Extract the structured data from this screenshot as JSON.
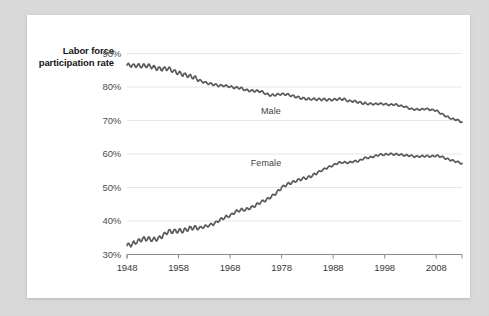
{
  "figure": {
    "background_color": "#dcdcdc",
    "card_color": "#ffffff",
    "line_color": "#5a5a5a",
    "grid_color": "#e6e6e6",
    "axis_color": "#8c8c8c"
  },
  "axis_title": "Labor force participation rate",
  "chart_data": {
    "type": "line",
    "title": "",
    "subtitle": "",
    "xlabel": "",
    "ylabel": "Labor force participation rate",
    "xlim": [
      1948,
      2013
    ],
    "ylim": [
      30,
      90
    ],
    "grid": true,
    "grid_axis": "y",
    "legend": "inline-annotations",
    "ytick_labels": [
      "90%",
      "80%",
      "70%",
      "60%",
      "50%",
      "40%",
      "30%"
    ],
    "ytick_values": [
      90,
      80,
      70,
      60,
      50,
      40,
      30
    ],
    "xtick_labels": [
      "1948",
      "1958",
      "1968",
      "1978",
      "1988",
      "1998",
      "2008"
    ],
    "xtick_values": [
      1948,
      1958,
      1968,
      1978,
      1988,
      1998,
      2008
    ],
    "annotations": [
      {
        "text": "Male",
        "x": 1974,
        "y": 72.5
      },
      {
        "text": "Female",
        "x": 1972,
        "y": 57.0
      }
    ],
    "series": [
      {
        "name": "Male",
        "label": "Male",
        "color": "#5a5a5a",
        "x": [
          1948,
          1949,
          1950,
          1951,
          1952,
          1953,
          1954,
          1955,
          1956,
          1957,
          1958,
          1959,
          1960,
          1961,
          1962,
          1963,
          1964,
          1965,
          1966,
          1967,
          1968,
          1969,
          1970,
          1971,
          1972,
          1973,
          1974,
          1975,
          1976,
          1977,
          1978,
          1979,
          1980,
          1981,
          1982,
          1983,
          1984,
          1985,
          1986,
          1987,
          1988,
          1989,
          1990,
          1991,
          1992,
          1993,
          1994,
          1995,
          1996,
          1997,
          1998,
          1999,
          2000,
          2001,
          2002,
          2003,
          2004,
          2005,
          2006,
          2007,
          2008,
          2009,
          2010,
          2011,
          2012,
          2013
        ],
        "values": [
          86.6,
          86.4,
          86.4,
          86.3,
          86.3,
          86.0,
          85.5,
          85.4,
          85.5,
          84.8,
          84.2,
          83.7,
          83.3,
          82.9,
          82.0,
          81.4,
          81.0,
          80.7,
          80.4,
          80.4,
          80.1,
          79.8,
          79.7,
          79.1,
          78.9,
          78.8,
          78.7,
          77.9,
          77.5,
          77.7,
          77.9,
          77.8,
          77.4,
          77.0,
          76.6,
          76.4,
          76.4,
          76.3,
          76.3,
          76.2,
          76.2,
          76.4,
          76.4,
          75.8,
          75.8,
          75.4,
          75.1,
          75.0,
          74.9,
          75.0,
          74.9,
          74.7,
          74.8,
          74.4,
          74.1,
          73.5,
          73.3,
          73.3,
          73.5,
          73.2,
          73.0,
          72.0,
          71.2,
          70.5,
          70.2,
          69.5
        ]
      },
      {
        "name": "Female",
        "label": "Female",
        "color": "#5a5a5a",
        "x": [
          1948,
          1949,
          1950,
          1951,
          1952,
          1953,
          1954,
          1955,
          1956,
          1957,
          1958,
          1959,
          1960,
          1961,
          1962,
          1963,
          1964,
          1965,
          1966,
          1967,
          1968,
          1969,
          1970,
          1971,
          1972,
          1973,
          1974,
          1975,
          1976,
          1977,
          1978,
          1979,
          1980,
          1981,
          1982,
          1983,
          1984,
          1985,
          1986,
          1987,
          1988,
          1989,
          1990,
          1991,
          1992,
          1993,
          1994,
          1995,
          1996,
          1997,
          1998,
          1999,
          2000,
          2001,
          2002,
          2003,
          2004,
          2005,
          2006,
          2007,
          2008,
          2009,
          2010,
          2011,
          2012,
          2013
        ],
        "values": [
          32.7,
          33.1,
          33.9,
          34.6,
          34.7,
          34.4,
          34.6,
          35.7,
          36.9,
          36.9,
          37.1,
          37.1,
          37.7,
          38.1,
          37.9,
          38.3,
          38.7,
          39.3,
          40.3,
          41.1,
          41.6,
          42.7,
          43.3,
          43.4,
          43.9,
          44.7,
          45.7,
          46.3,
          47.3,
          48.4,
          50.0,
          50.9,
          51.5,
          52.1,
          52.6,
          52.9,
          53.6,
          54.5,
          55.3,
          56.0,
          56.6,
          57.4,
          57.5,
          57.4,
          57.8,
          57.9,
          58.8,
          58.9,
          59.3,
          59.8,
          59.8,
          60.0,
          59.9,
          59.8,
          59.6,
          59.5,
          59.2,
          59.3,
          59.4,
          59.3,
          59.5,
          59.2,
          58.6,
          58.1,
          57.7,
          57.2
        ]
      }
    ]
  }
}
